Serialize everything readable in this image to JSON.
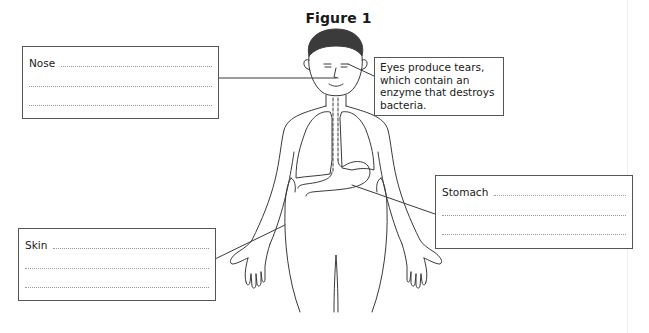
{
  "figure": {
    "title": "Figure 1"
  },
  "labels": {
    "nose": {
      "label": "Nose",
      "answer_lines": 3
    },
    "eyes": {
      "lines": [
        "Eyes produce tears,",
        "which contain an",
        "enzyme that destroys",
        "bacteria."
      ]
    },
    "stomach": {
      "label": "Stomach",
      "answer_lines": 3
    },
    "skin": {
      "label": "Skin",
      "answer_lines": 3
    }
  },
  "colors": {
    "line": "#3a3a3a",
    "hair": "#3b3b3b",
    "box_border": "#555555",
    "dotted_rule": "#9a9a9a"
  }
}
